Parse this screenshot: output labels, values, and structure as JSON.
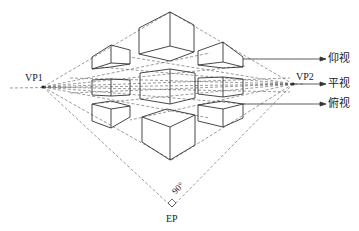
{
  "diagram": {
    "vanishing_points": [
      {
        "id": "VP1",
        "label": "VP1",
        "x": 43,
        "y": 87
      },
      {
        "id": "VP2",
        "label": "VP2",
        "x": 293,
        "y": 84
      }
    ],
    "eye_point": {
      "label": "EP",
      "x": 172,
      "y": 207,
      "angle_label": "90°"
    },
    "view_labels": [
      {
        "label": "仰视",
        "meaning": "worm's-eye view (looking up)",
        "y": 59
      },
      {
        "label": "平视",
        "meaning": "eye-level view",
        "y": 84
      },
      {
        "label": "俯视",
        "meaning": "bird's-eye view (looking down)",
        "y": 104
      }
    ],
    "colors": {
      "line": "#333333",
      "dash": "#555555",
      "background": "#ffffff"
    }
  }
}
